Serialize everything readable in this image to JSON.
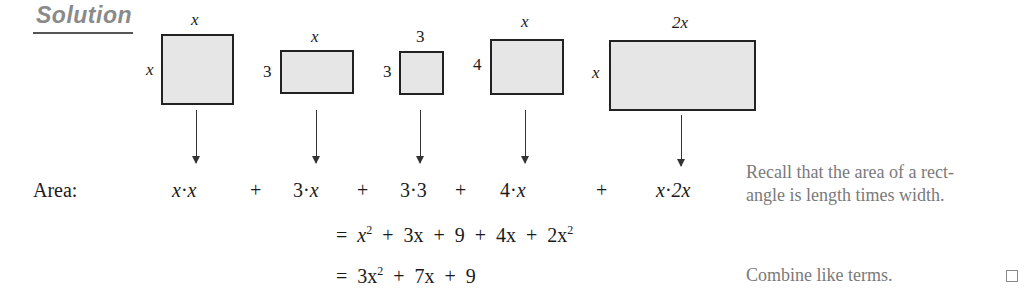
{
  "heading": {
    "title": "Solution"
  },
  "rectangles": [
    {
      "top_label": "x",
      "side_label": "x",
      "expr_left": "x",
      "expr_op": "·",
      "expr_right": "x"
    },
    {
      "top_label": "x",
      "side_label": "3",
      "expr_left": "3",
      "expr_op": "·",
      "expr_right": "x"
    },
    {
      "top_label": "3",
      "side_label": "3",
      "expr_left": "3",
      "expr_op": "·",
      "expr_right": "3"
    },
    {
      "top_label": "x",
      "side_label": "4",
      "expr_left": "4",
      "expr_op": "·",
      "expr_right": "x"
    },
    {
      "top_label": "2x",
      "side_label": "x",
      "expr_left": "x",
      "expr_op": "·",
      "expr_right": "2x"
    }
  ],
  "area_line": {
    "label": "Area:",
    "plus": "+"
  },
  "steps": [
    {
      "eq": "=",
      "terms": [
        {
          "t": "x",
          "sup": "2"
        },
        {
          "op": "+"
        },
        {
          "t": "3x"
        },
        {
          "op": "+"
        },
        {
          "t": "9"
        },
        {
          "op": "+"
        },
        {
          "t": "4x"
        },
        {
          "op": "+"
        },
        {
          "t": "2x",
          "sup": "2"
        }
      ]
    },
    {
      "eq": "=",
      "terms": [
        {
          "t": "3x",
          "sup": "2"
        },
        {
          "op": "+"
        },
        {
          "t": "7x"
        },
        {
          "op": "+"
        },
        {
          "t": "9"
        }
      ]
    }
  ],
  "notes": {
    "recall_line1": "Recall that the area of a rect-",
    "recall_line2": "angle is length times width.",
    "combine": "Combine like terms."
  },
  "end_mark": "□"
}
